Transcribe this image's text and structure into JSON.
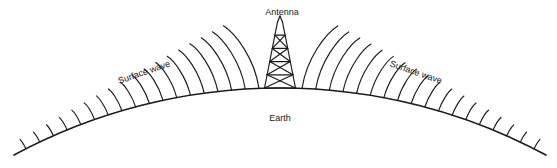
{
  "figure": {
    "title_visible": false,
    "background_color": "#ffffff",
    "stroke_color": "#1a1a1a",
    "width": 557,
    "height": 168
  },
  "labels": {
    "antenna": "Antenna",
    "earth": "Earth",
    "surface_wave_left": "Surface wave",
    "surface_wave_right": "Surface wave"
  },
  "label_positions": {
    "antenna": {
      "x": 282,
      "y": 15,
      "rotation": 0,
      "anchor": "middle"
    },
    "earth": {
      "x": 280,
      "y": 121,
      "rotation": 0,
      "anchor": "middle"
    },
    "surface_wave_left": {
      "x": 145,
      "y": 75,
      "rotation": -19,
      "anchor": "middle"
    },
    "surface_wave_right": {
      "x": 415,
      "y": 75,
      "rotation": 19,
      "anchor": "middle"
    }
  },
  "earth": {
    "description": "curved earth surface arc, apex under antenna",
    "left_end": {
      "x": 14,
      "y": 155
    },
    "apex": {
      "x": 280,
      "y": 88
    },
    "right_end": {
      "x": 546,
      "y": 155
    },
    "stroke_width": 1.6
  },
  "antenna": {
    "description": "lattice mast tower with X cross-bracing",
    "base_left_x": 265,
    "base_right_x": 296,
    "base_y": 88,
    "top_y": 22,
    "tip_x": 280,
    "tip_half_width": 2.5,
    "sections": 5,
    "cross_braced_sections": 4,
    "stroke_width": 1.2
  },
  "waves": {
    "description": "radiating surface-wave arcs springing from the earth curve on both sides of the antenna, tallest nearest the antenna and progressively shorter toward the horizon",
    "count_left": 18,
    "count_right": 18,
    "max_height": 60,
    "min_height": 11,
    "stroke_width": 1.15,
    "lean": "arcs curve away from the antenna"
  },
  "chart_data": {
    "type": "diagram"
  }
}
